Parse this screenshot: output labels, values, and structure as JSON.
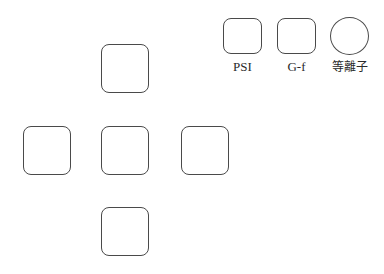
{
  "legend": {
    "items": [
      {
        "shape": "rounded-square",
        "label": "PSI"
      },
      {
        "shape": "rounded-square",
        "label": "G-f"
      },
      {
        "shape": "circle",
        "label": "等離子"
      }
    ]
  },
  "cross_layout": {
    "cells": [
      {
        "position": "top"
      },
      {
        "position": "left"
      },
      {
        "position": "center"
      },
      {
        "position": "right"
      },
      {
        "position": "bottom"
      }
    ]
  },
  "colors": {
    "stroke": "#4a4a4a",
    "background": "#ffffff",
    "text": "#2a2a2a"
  }
}
